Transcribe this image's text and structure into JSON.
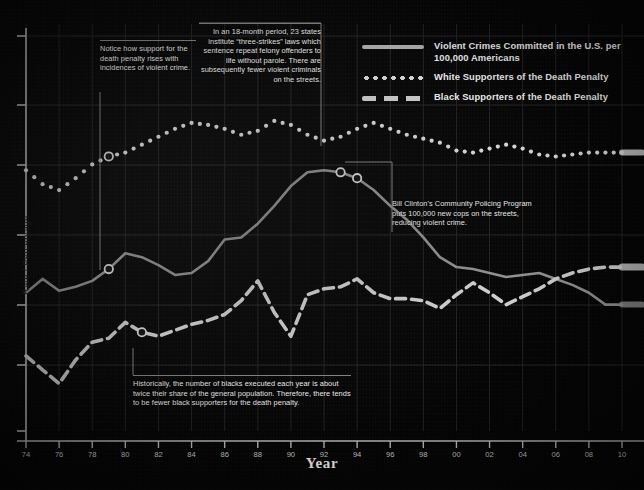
{
  "axes": {
    "x_title": "Year",
    "y_title": "Rate / Percentage",
    "x_ticks": [
      "74",
      "76",
      "78",
      "80",
      "82",
      "84",
      "86",
      "88",
      "90",
      "92",
      "94",
      "96",
      "98",
      "00",
      "02",
      "04",
      "06",
      "08",
      "10"
    ]
  },
  "legend": {
    "items": [
      {
        "key": "solid-line-key",
        "label": "Violent Crimes Committed in the U.S. per 100,000 Americans"
      },
      {
        "key": "dotted-line-key",
        "label": "White Supporters of the Death Penalty"
      },
      {
        "key": "dashed-line-key",
        "label": "Black Supporters of the Death Penalty"
      }
    ]
  },
  "annotations": [
    {
      "id": "support-note",
      "text": "Notice how support for the death penalty rises with incidences of violent crime."
    },
    {
      "id": "three-strikes-note",
      "text": "In an 18-month period, 23 states institute “three-strikes” laws which sentence repeat felony offenders to life without parole. There are subsequently fewer violent criminals on the streets."
    },
    {
      "id": "clinton-note",
      "text": "Bill Clinton's Community Policing Program puts 100,000 new cops on the streets, reducing  violent crime."
    },
    {
      "id": "black-executions-note",
      "text": "Historically, the number of blacks executed each year is about twice their share of the general population. Therefore, there tends to be fewer black supporters for the death penalty."
    }
  ],
  "colors": {
    "background": "#050505",
    "grid": "#2a2a2a",
    "axis": "#c9c9c9",
    "violent_crime": "#9a9a9a",
    "white_supporters": "#e8e8e8",
    "black_supporters": "#dcdcdc",
    "text": "#ffffff"
  },
  "chart_data": {
    "type": "line",
    "title": "",
    "subtitle": "",
    "xlabel": "Year",
    "ylabel": "Rate / Percentage",
    "grid": true,
    "legend_position": "top-right",
    "x": [
      1974,
      1975,
      1976,
      1977,
      1978,
      1979,
      1980,
      1981,
      1982,
      1983,
      1984,
      1985,
      1986,
      1987,
      1988,
      1989,
      1990,
      1991,
      1992,
      1993,
      1994,
      1995,
      1996,
      1997,
      1998,
      1999,
      2000,
      2001,
      2002,
      2003,
      2004,
      2005,
      2006,
      2007,
      2008,
      2009,
      2010
    ],
    "x_tick_labels": [
      "74",
      "76",
      "78",
      "80",
      "82",
      "84",
      "86",
      "88",
      "90",
      "92",
      "94",
      "96",
      "98",
      "00",
      "02",
      "04",
      "06",
      "08",
      "10"
    ],
    "xlim": [
      1974,
      2010
    ],
    "ylim": [
      0,
      100
    ],
    "series": [
      {
        "name": "Violent Crimes Committed in the U.S. per 100,000 Americans",
        "style": "solid",
        "color": "#9a9a9a",
        "values": [
          35.0,
          38.5,
          35.5,
          36.5,
          38.0,
          41.0,
          45.0,
          44.0,
          42.0,
          39.5,
          40.0,
          43.0,
          48.5,
          49.0,
          52.5,
          57.0,
          62.0,
          65.5,
          66.0,
          65.5,
          64.0,
          61.0,
          57.0,
          53.5,
          49.0,
          44.0,
          41.5,
          41.0,
          40.0,
          39.0,
          39.5,
          40.0,
          38.5,
          37.0,
          35.0,
          32.0,
          32.0
        ]
      },
      {
        "name": "White Supporters of the Death Penalty",
        "style": "dotted",
        "color": "#e8e8e8",
        "values": [
          66.0,
          62.5,
          61.0,
          64.0,
          67.5,
          69.5,
          70.5,
          72.5,
          74.5,
          76.5,
          78.0,
          77.5,
          76.5,
          75.0,
          76.0,
          78.5,
          77.5,
          75.0,
          73.5,
          74.5,
          76.5,
          78.0,
          76.5,
          75.0,
          74.0,
          73.0,
          71.0,
          70.5,
          71.5,
          72.5,
          71.5,
          70.0,
          69.5,
          70.0,
          70.5,
          70.5,
          70.5
        ]
      },
      {
        "name": "Black Supporters of the Death Penalty",
        "style": "dashed",
        "color": "#dcdcdc",
        "values": [
          19.0,
          15.5,
          12.0,
          18.0,
          22.5,
          23.5,
          27.5,
          25.0,
          24.0,
          25.5,
          27.0,
          28.0,
          29.5,
          33.0,
          38.0,
          30.0,
          24.0,
          34.5,
          36.0,
          36.5,
          38.5,
          35.0,
          33.5,
          33.5,
          33.0,
          31.0,
          34.5,
          37.5,
          35.0,
          32.0,
          34.0,
          36.0,
          38.5,
          40.0,
          41.0,
          41.5,
          41.5
        ]
      }
    ],
    "annotation_anchors": [
      {
        "series": "White Supporters of the Death Penalty",
        "x": 1979,
        "label": "support-note"
      },
      {
        "series": "Violent Crimes Committed in the U.S. per 100,000 Americans",
        "x": 1979,
        "label": "support-note"
      },
      {
        "series": "Violent Crimes Committed in the U.S. per 100,000 Americans",
        "x": 1993,
        "label": "three-strikes-note"
      },
      {
        "series": "Violent Crimes Committed in the U.S. per 100,000 Americans",
        "x": 1994,
        "label": "clinton-note"
      },
      {
        "series": "Black Supporters of the Death Penalty",
        "x": 1981,
        "label": "black-executions-note"
      }
    ]
  }
}
